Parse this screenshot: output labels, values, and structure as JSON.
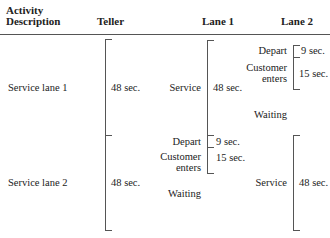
{
  "headers": {
    "activity_line1": "Activity",
    "activity_line2": "Description",
    "teller": "Teller",
    "lane1": "Lane 1",
    "lane2": "Lane 2"
  },
  "rows": [
    {
      "activity": "Service lane 1",
      "teller_time": "48 sec."
    },
    {
      "activity": "Service lane 2",
      "teller_time": "48 sec."
    }
  ],
  "lane1": {
    "service_label": "Service",
    "service_time": "48 sec.",
    "depart_label": "Depart",
    "depart_time": "9 sec.",
    "enters_label1": "Customer",
    "enters_label2": "enters",
    "enters_time": "15 sec.",
    "waiting_label": "Waiting"
  },
  "lane2": {
    "depart_label": "Depart",
    "depart_time": "9 sec.",
    "enters_label1": "Customer",
    "enters_label2": "enters",
    "enters_time": "15 sec.",
    "waiting_label": "Waiting",
    "service_label": "Service",
    "service_time": "48 sec."
  }
}
